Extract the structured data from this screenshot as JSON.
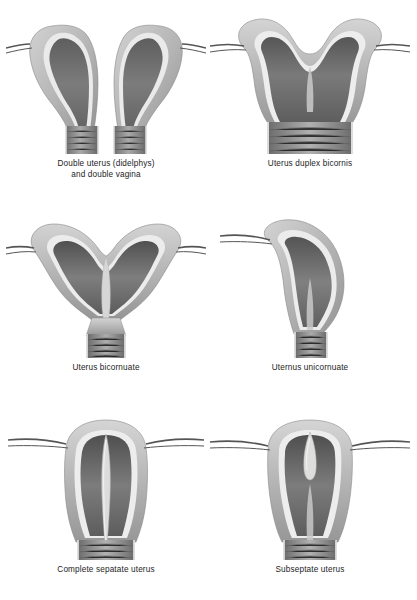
{
  "document": {
    "kind": "medical-illustration-plate",
    "subject": "Congenital uterine anomalies",
    "background_color": "#ffffff",
    "caption_color": "#1c1c1c",
    "palette": {
      "myometrium_light": "#c9c9c9",
      "myometrium_mid": "#a8a8a8",
      "myometrium_dark": "#8b8b8b",
      "endometrium_line": "#e8e8e8",
      "cavity_dark": "#6f6f6f",
      "cavity_darkest": "#4d4d4d",
      "canal_gray": "#8f8f8f",
      "tube_line": "#5a5a5a",
      "outline": "#7a7a7a"
    }
  },
  "figures": [
    {
      "id": "didelphys",
      "caption": "Double uterus (didelphys)\nand double vagina",
      "caption_lines": [
        "Double uterus (didelphys)",
        "and double vagina"
      ],
      "position": "row-1 column-left",
      "horns": 2,
      "cervices": 2,
      "vaginas": 2,
      "fallopian_tubes": 2
    },
    {
      "id": "duplex-bicornis",
      "caption": "Uterus duplex bicornis",
      "caption_lines": [
        "Uterus duplex bicornis"
      ],
      "position": "row-1 column-right",
      "horns": 2,
      "cervices": 1,
      "vaginas": 1,
      "fallopian_tubes": 2
    },
    {
      "id": "bicornuate",
      "caption": "Uterus bicornuate",
      "caption_lines": [
        "Uterus bicornuate"
      ],
      "position": "row-2 column-left",
      "horns": 2,
      "cervices": 1,
      "vaginas": 1,
      "fallopian_tubes": 2
    },
    {
      "id": "unicornuate",
      "caption": "Uternus unicornuate",
      "caption_lines": [
        "Uternus unicornuate"
      ],
      "position": "row-2 column-right",
      "horns": 1,
      "cervices": 1,
      "vaginas": 1,
      "fallopian_tubes": 1
    },
    {
      "id": "complete-septate",
      "caption": "Complete sepatate uterus",
      "caption_lines": [
        "Complete sepatate uterus"
      ],
      "position": "row-3 column-left",
      "horns": 1,
      "cervices": 1,
      "vaginas": 1,
      "fallopian_tubes": 2,
      "septum": "complete"
    },
    {
      "id": "subseptate",
      "caption": "Subseptate uterus",
      "caption_lines": [
        "Subseptate uterus"
      ],
      "position": "row-3 column-right",
      "horns": 1,
      "cervices": 1,
      "vaginas": 1,
      "fallopian_tubes": 2,
      "septum": "partial"
    }
  ]
}
